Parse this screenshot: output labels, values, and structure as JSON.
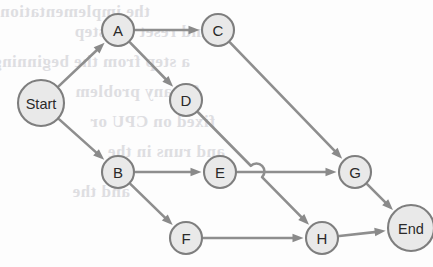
{
  "diagram": {
    "type": "directed-acyclic-graph",
    "geometry": {
      "width": 433,
      "height": 267
    },
    "style": {
      "node_fill": "#e9e9e9",
      "node_stroke": "#7e7e7e",
      "edge_color": "#8e8e8e",
      "arrow_color": "#8a8a8a",
      "label_color": "#2a2a2a",
      "background": "#fdfdfd",
      "ghost_text_color": "#d9d9dd"
    },
    "nodes": [
      {
        "id": "Start",
        "label": "Start",
        "cx": 41,
        "cy": 103,
        "r": 23,
        "kind": "terminal"
      },
      {
        "id": "A",
        "label": "A",
        "cx": 118,
        "cy": 30,
        "r": 16,
        "kind": "task"
      },
      {
        "id": "C",
        "label": "C",
        "cx": 218,
        "cy": 30,
        "r": 16,
        "kind": "task"
      },
      {
        "id": "D",
        "label": "D",
        "cx": 186,
        "cy": 100,
        "r": 16,
        "kind": "task"
      },
      {
        "id": "B",
        "label": "B",
        "cx": 118,
        "cy": 172,
        "r": 16,
        "kind": "task"
      },
      {
        "id": "E",
        "label": "E",
        "cx": 220,
        "cy": 172,
        "r": 16,
        "kind": "task"
      },
      {
        "id": "G",
        "label": "G",
        "cx": 355,
        "cy": 172,
        "r": 16,
        "kind": "task"
      },
      {
        "id": "F",
        "label": "F",
        "cx": 186,
        "cy": 238,
        "r": 16,
        "kind": "task"
      },
      {
        "id": "H",
        "label": "H",
        "cx": 322,
        "cy": 238,
        "r": 16,
        "kind": "task"
      },
      {
        "id": "End",
        "label": "End",
        "cx": 411,
        "cy": 228,
        "r": 23,
        "kind": "terminal"
      }
    ],
    "edges": [
      {
        "id": "start-a",
        "from": "Start",
        "to": "A",
        "directed": true,
        "hop": false
      },
      {
        "id": "start-b",
        "from": "Start",
        "to": "B",
        "directed": true,
        "hop": false
      },
      {
        "id": "a-c",
        "from": "A",
        "to": "C",
        "directed": true,
        "hop": false
      },
      {
        "id": "a-d",
        "from": "A",
        "to": "D",
        "directed": true,
        "hop": false
      },
      {
        "id": "b-e",
        "from": "B",
        "to": "E",
        "directed": true,
        "hop": false
      },
      {
        "id": "b-f",
        "from": "B",
        "to": "F",
        "directed": true,
        "hop": false
      },
      {
        "id": "c-g",
        "from": "C",
        "to": "G",
        "directed": true,
        "hop": false
      },
      {
        "id": "d-h",
        "from": "D",
        "to": "H",
        "directed": true,
        "hop": true,
        "hop_at": {
          "x": 262,
          "y": 166,
          "r": 8
        }
      },
      {
        "id": "e-g",
        "from": "E",
        "to": "G",
        "directed": true,
        "hop": false
      },
      {
        "id": "f-h",
        "from": "F",
        "to": "H",
        "directed": true,
        "hop": false
      },
      {
        "id": "g-end",
        "from": "G",
        "to": "End",
        "directed": true,
        "hop": false
      },
      {
        "id": "h-end",
        "from": "H",
        "to": "End",
        "directed": true,
        "hop": false
      }
    ]
  },
  "ghost_text": [
    {
      "text": "the implementation",
      "x": 150,
      "y": 2,
      "size": 17
    },
    {
      "text": "and reset the step",
      "x": 210,
      "y": 22,
      "size": 17
    },
    {
      "text": "a step from the beginning",
      "x": 190,
      "y": 52,
      "size": 17
    },
    {
      "text": "for any problem",
      "x": 200,
      "y": 82,
      "size": 17
    },
    {
      "text": "fixed on CPU or",
      "x": 215,
      "y": 112,
      "size": 17
    },
    {
      "text": "and runs in the",
      "x": 225,
      "y": 142,
      "size": 17
    },
    {
      "text": "and the",
      "x": 130,
      "y": 182,
      "size": 17
    }
  ]
}
